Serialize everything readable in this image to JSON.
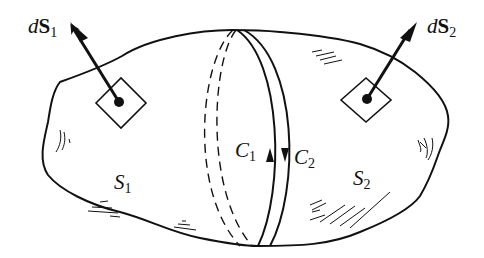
{
  "figure": {
    "colors": {
      "ink": "#111111",
      "background": "#ffffff"
    }
  },
  "labels": {
    "dS1": {
      "d": "d",
      "S": "S",
      "sub": "1"
    },
    "dS2": {
      "d": "d",
      "S": "S",
      "sub": "2"
    },
    "S1": {
      "S": "S",
      "sub": "1"
    },
    "S2": {
      "S": "S",
      "sub": "2"
    },
    "C1": {
      "C": "C",
      "sub": "1"
    },
    "C2": {
      "C": "C",
      "sub": "2"
    }
  },
  "annotations": {
    "C1_direction": "up",
    "C2_direction": "down"
  }
}
